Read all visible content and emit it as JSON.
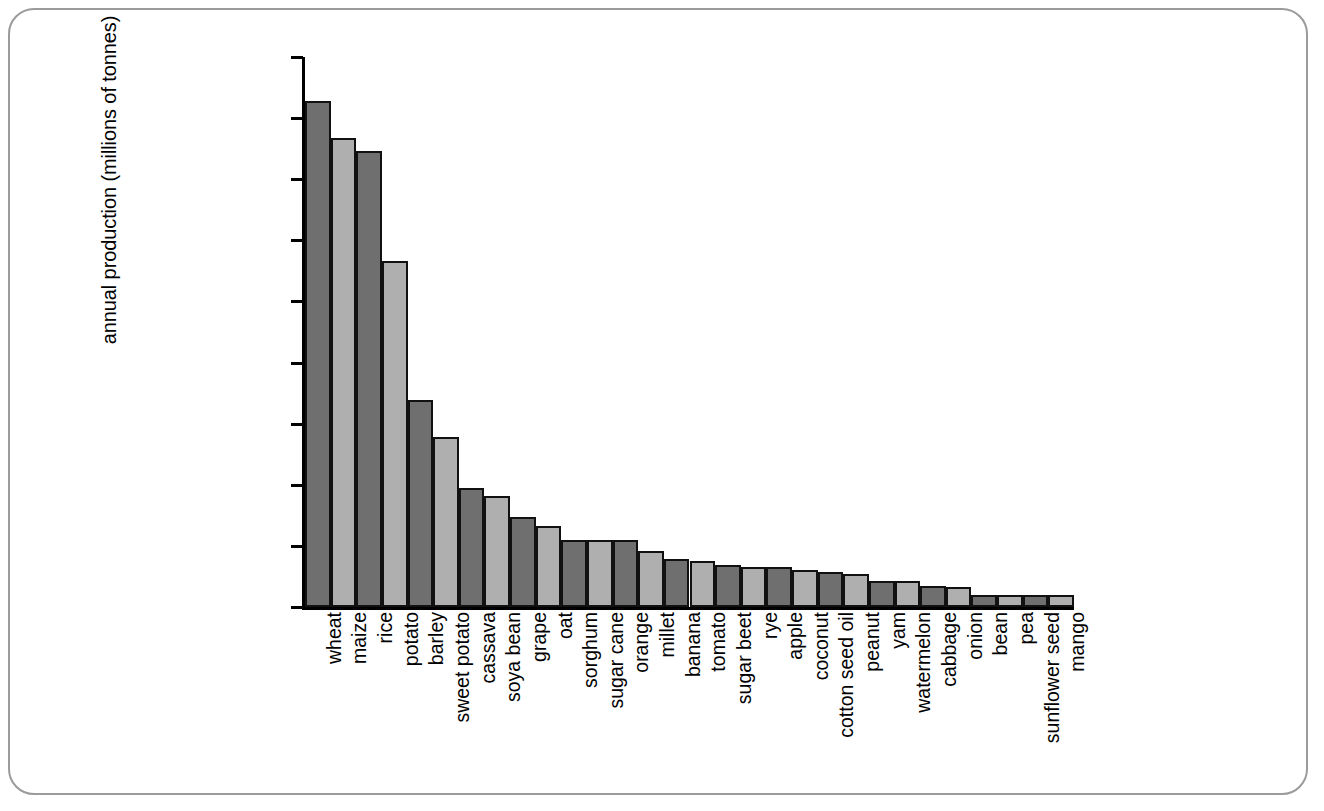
{
  "chart_data": {
    "type": "bar",
    "title": "",
    "subtitle": "",
    "xlabel": "",
    "ylabel": "annual production (millions of tonnes)",
    "ylim": [
      0,
      450
    ],
    "ytick_step": 50,
    "yticks": [
      450,
      400,
      350,
      300,
      250,
      200,
      150,
      100,
      50,
      0
    ],
    "grid": false,
    "legend": null,
    "bar_colors": {
      "dark": "#6f6f6f",
      "light": "#afafaf",
      "outline": "#111111"
    },
    "categories": [
      "wheat",
      "maize",
      "rice",
      "potato",
      "barley",
      "sweet potato",
      "cassava",
      "soya bean",
      "grape",
      "oat",
      "sorghum",
      "sugar cane",
      "orange",
      "millet",
      "banana",
      "tomato",
      "sugar beet",
      "rye",
      "apple",
      "coconut",
      "cotton seed oil",
      "peanut",
      "yam",
      "watermelon",
      "cabbage",
      "onion",
      "bean",
      "pea",
      "sunflower seed",
      "mango"
    ],
    "values": [
      414,
      384,
      373,
      283,
      169,
      139,
      97,
      91,
      74,
      66,
      55,
      55,
      55,
      46,
      39,
      38,
      34,
      33,
      33,
      30,
      29,
      27,
      21,
      21,
      17,
      16,
      10,
      10,
      10,
      10
    ]
  },
  "frame": {
    "border_color": "#9b9b9b",
    "background": "#ffffff"
  }
}
